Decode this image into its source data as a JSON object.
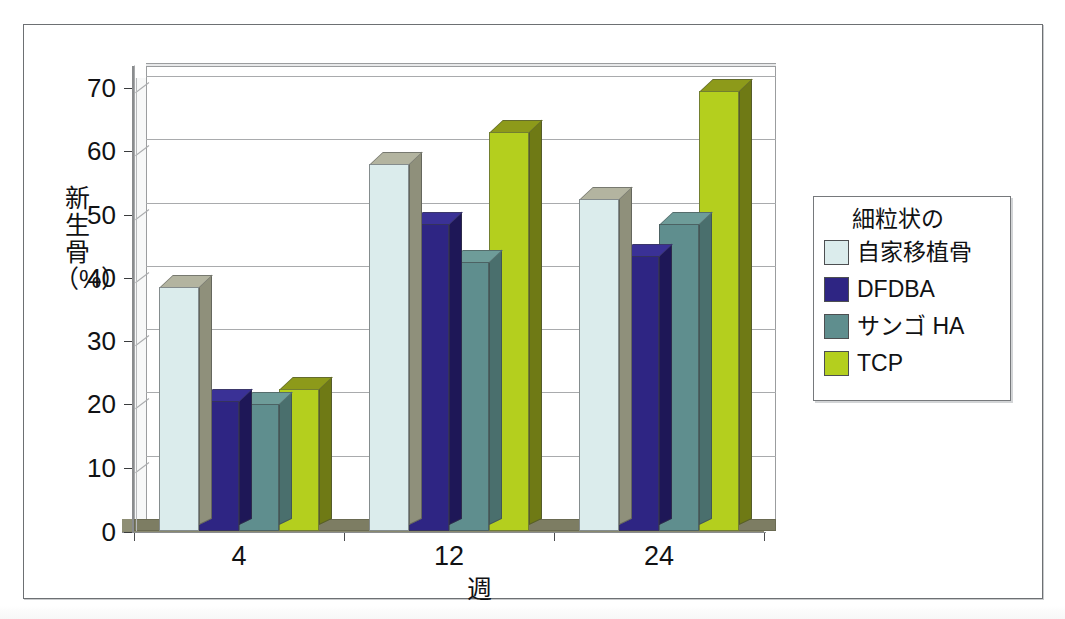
{
  "chart_data": {
    "type": "bar",
    "title": "",
    "xlabel": "週",
    "ylabel": "新生骨（%）",
    "ylabel_chars": [
      "新",
      "生",
      "骨",
      "（%）"
    ],
    "categories": [
      "4",
      "12",
      "24"
    ],
    "ylim": [
      0,
      70
    ],
    "ytick_labels": [
      "0",
      "10",
      "20",
      "30",
      "40",
      "50",
      "60",
      "70"
    ],
    "ytick_values": [
      0,
      10,
      20,
      30,
      40,
      50,
      60,
      70
    ],
    "grid": true,
    "legend_position": "right",
    "legend_title": "細粒状の",
    "series": [
      {
        "name": "自家移植骨",
        "legend_label": "自家移植骨",
        "color": "#dbecec",
        "side_color": "#8f907b",
        "top_color": "#b3b4a0",
        "values": [
          38.5,
          58,
          52.5
        ]
      },
      {
        "name": "DFDBA",
        "legend_label": "DFDBA",
        "color": "#2e2583",
        "side_color": "#1e1757",
        "top_color": "#3a3196",
        "values": [
          20.5,
          48.5,
          43.5
        ]
      },
      {
        "name": "サンゴ HA",
        "legend_label": "サンゴ HA",
        "color": "#5f8e8e",
        "side_color": "#4a6f6d",
        "top_color": "#6e9c99",
        "values": [
          20,
          42.5,
          48.5
        ]
      },
      {
        "name": "TCP",
        "legend_label": "TCP",
        "color": "#b4cf1e",
        "side_color": "#6f7a15",
        "top_color": "#8d9a1a",
        "values": [
          22.5,
          63,
          69.5
        ]
      }
    ]
  },
  "figure": {
    "frame_border_color": "#6d7073",
    "plot_wall_color": "#ffffff",
    "gridline_color": "#a9abad",
    "floor_color": "#7d7d63",
    "axis_color": "#8a8c8e"
  }
}
